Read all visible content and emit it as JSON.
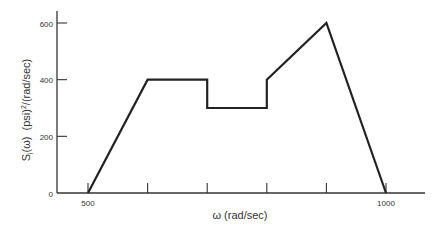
{
  "chart_data": {
    "type": "line",
    "title": "",
    "xlabel": "ω (rad/sec)",
    "ylabel": "S_i(ω)  (psi)²/(rad/sec)",
    "ylabel_parts": {
      "s": "S",
      "sub": "i",
      "omega": "(ω)",
      "units": "(psi)",
      "sup": "2",
      "rest": "/(rad/sec)"
    },
    "x": [
      500,
      600,
      700,
      700,
      800,
      800,
      900,
      1000
    ],
    "y": [
      0,
      400,
      400,
      300,
      300,
      400,
      600,
      0
    ],
    "xlim": [
      460,
      1070
    ],
    "ylim": [
      0,
      650
    ],
    "x_ticks": [
      500,
      600,
      700,
      800,
      900,
      1000
    ],
    "x_tick_labels": {
      "500": "500",
      "1000": "1000"
    },
    "y_ticks": [
      0,
      200,
      400,
      600
    ],
    "y_tick_labels": [
      "0",
      "200",
      "400",
      "600"
    ],
    "grid": false,
    "legend": null,
    "line_color": "#222222"
  }
}
